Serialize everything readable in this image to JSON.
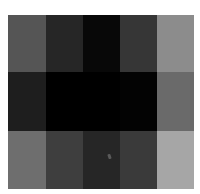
{
  "image": {
    "description": "Grayscale blocky mosaic of 5 columns by 3 rows",
    "columns": 5,
    "rows": 3,
    "col_edges": [
      0,
      38,
      75,
      112,
      149,
      186
    ],
    "row_edges": [
      0,
      57,
      116,
      174
    ],
    "cells": [
      [
        "#555555",
        "#262626",
        "#080808",
        "#363636",
        "#8c8c8c"
      ],
      [
        "#1e1e1e",
        "#000000",
        "#000000",
        "#030303",
        "#6a6a6a"
      ],
      [
        "#6e6e6e",
        "#3e3e3e",
        "#262626",
        "#3a3a3a",
        "#a6a6a6"
      ]
    ],
    "artifact": {
      "x": 100,
      "y": 139
    }
  }
}
